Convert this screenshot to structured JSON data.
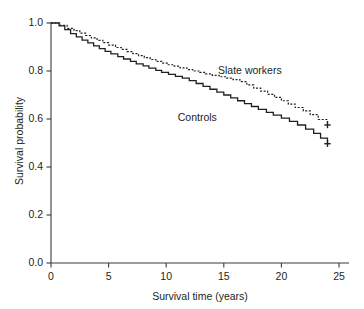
{
  "chart_data": {
    "type": "line",
    "subtype": "kaplan-meier-step",
    "title": "",
    "xlabel": "Survival time (years)",
    "ylabel": "Survival probability",
    "xlim": [
      0,
      26
    ],
    "ylim": [
      0.0,
      1.0
    ],
    "xticks": [
      0,
      5,
      10,
      15,
      20,
      25
    ],
    "xticklabels": [
      "0",
      "5",
      "10",
      "15",
      "20",
      "25"
    ],
    "yticks": [
      0.0,
      0.2,
      0.4,
      0.6,
      0.8,
      1.0
    ],
    "yticklabels": [
      "0.0",
      "0.2",
      "0.4",
      "0.6",
      "0.8",
      "1.0"
    ],
    "grid": false,
    "legend_position": "inline-annotation",
    "series": [
      {
        "name": "Slate workers",
        "linestyle": "dotted",
        "color": "#231f20",
        "label_x": 14.5,
        "label_y": 0.8,
        "censor_marks": [
          {
            "x": 24.0,
            "y": 0.575
          }
        ],
        "x": [
          0.0,
          0.8,
          1.4,
          2.0,
          2.5,
          3.0,
          3.5,
          4.0,
          4.5,
          5.0,
          5.6,
          6.1,
          6.6,
          7.1,
          7.6,
          8.1,
          8.6,
          9.1,
          9.6,
          10.1,
          10.7,
          11.2,
          11.8,
          12.3,
          12.9,
          13.4,
          14.0,
          14.6,
          15.2,
          15.8,
          16.4,
          17.0,
          17.6,
          18.2,
          18.8,
          19.4,
          20.0,
          20.6,
          21.2,
          21.9,
          22.5,
          23.2,
          24.0
        ],
        "y": [
          1.0,
          0.99,
          0.978,
          0.968,
          0.958,
          0.948,
          0.938,
          0.928,
          0.918,
          0.908,
          0.898,
          0.89,
          0.881,
          0.872,
          0.864,
          0.856,
          0.848,
          0.84,
          0.833,
          0.826,
          0.82,
          0.813,
          0.806,
          0.8,
          0.794,
          0.788,
          0.782,
          0.776,
          0.77,
          0.764,
          0.756,
          0.742,
          0.729,
          0.716,
          0.703,
          0.69,
          0.676,
          0.662,
          0.648,
          0.634,
          0.618,
          0.598,
          0.575
        ]
      },
      {
        "name": "Controls",
        "linestyle": "solid",
        "color": "#231f20",
        "label_x": 11.0,
        "label_y": 0.605,
        "censor_marks": [
          {
            "x": 24.0,
            "y": 0.497
          }
        ],
        "x": [
          0.0,
          0.7,
          1.2,
          1.7,
          2.2,
          2.7,
          3.2,
          3.7,
          4.2,
          4.7,
          5.2,
          5.8,
          6.3,
          6.9,
          7.4,
          8.0,
          8.5,
          9.1,
          9.6,
          10.2,
          10.8,
          11.4,
          12.0,
          12.6,
          13.2,
          13.8,
          14.4,
          15.0,
          15.6,
          16.2,
          16.8,
          17.4,
          18.0,
          18.7,
          19.3,
          20.0,
          20.7,
          21.4,
          22.1,
          22.8,
          23.4,
          24.0
        ],
        "y": [
          1.0,
          0.988,
          0.972,
          0.956,
          0.942,
          0.929,
          0.917,
          0.905,
          0.893,
          0.882,
          0.871,
          0.86,
          0.85,
          0.84,
          0.83,
          0.821,
          0.812,
          0.803,
          0.794,
          0.786,
          0.778,
          0.77,
          0.76,
          0.748,
          0.736,
          0.724,
          0.712,
          0.7,
          0.688,
          0.676,
          0.664,
          0.652,
          0.64,
          0.628,
          0.616,
          0.604,
          0.59,
          0.575,
          0.558,
          0.54,
          0.52,
          0.497
        ]
      }
    ]
  },
  "axes": {
    "x_title": "Survival time (years)",
    "y_title": "Survival probability"
  }
}
